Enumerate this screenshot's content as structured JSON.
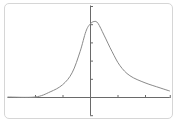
{
  "chart_data": {
    "type": "line",
    "title": "",
    "xlabel": "",
    "ylabel": "",
    "grid": false,
    "legend": null,
    "xlim": [
      -3.0,
      2.9
    ],
    "ylim": [
      -1.0,
      5.0
    ],
    "x_ticks": [
      -2,
      -1,
      0,
      1,
      2
    ],
    "y_ticks": [
      -1,
      1,
      2,
      3,
      4,
      5
    ],
    "tick_labels_shown": false,
    "series": [
      {
        "name": "curve",
        "color": "#8a8a8a",
        "x": [
          -3.0,
          -2.0,
          -1.45,
          -1.0,
          -0.65,
          -0.36,
          -0.15,
          0.0,
          0.15,
          0.29,
          0.51,
          0.8,
          1.09,
          1.45,
          2.0,
          2.55,
          2.9
        ],
        "y": [
          0.0,
          0.0,
          0.28,
          0.67,
          1.33,
          2.5,
          3.6,
          4.0,
          4.15,
          4.05,
          3.4,
          2.5,
          1.72,
          1.17,
          0.78,
          0.5,
          0.33
        ]
      }
    ],
    "axes": {
      "origin": [
        0,
        0
      ],
      "axis_color": "#6a6a6a"
    }
  },
  "colors": {
    "frame_border": "#d6d6d6",
    "axis": "#6a6a6a",
    "curve": "#8a8a8a",
    "background": "#ffffff"
  }
}
